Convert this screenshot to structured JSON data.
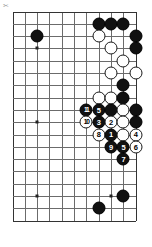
{
  "corner_mark": "✂",
  "board": {
    "grid": {
      "origin_x": 12.5,
      "origin_y": 11.5,
      "spacing": 12.3,
      "cols": 11,
      "rows": 18,
      "line_color": "#6b6b6b",
      "edge_color": "#333333",
      "background": "#ffffff"
    },
    "star_points": [
      {
        "col": 2,
        "row": 3
      },
      {
        "col": 8,
        "row": 3
      },
      {
        "col": 2,
        "row": 9
      },
      {
        "col": 8,
        "row": 15
      },
      {
        "col": 2,
        "row": 15
      }
    ],
    "colors": {
      "black": "#111111",
      "white": "#ffffff",
      "stone_outline": "#1a1a1a"
    },
    "stones": [
      {
        "name": "black-stone",
        "color": "b",
        "col": 2,
        "row": 2,
        "label": ""
      },
      {
        "name": "black-stone",
        "color": "b",
        "col": 7,
        "row": 1,
        "label": ""
      },
      {
        "name": "black-stone",
        "color": "b",
        "col": 8,
        "row": 1,
        "label": ""
      },
      {
        "name": "black-stone",
        "color": "b",
        "col": 9,
        "row": 1,
        "label": ""
      },
      {
        "name": "white-stone",
        "color": "w",
        "col": 7,
        "row": 2,
        "label": ""
      },
      {
        "name": "black-stone",
        "color": "b",
        "col": 10,
        "row": 2,
        "label": ""
      },
      {
        "name": "white-stone",
        "color": "w",
        "col": 8,
        "row": 3,
        "label": ""
      },
      {
        "name": "black-stone",
        "color": "b",
        "col": 10,
        "row": 3,
        "label": ""
      },
      {
        "name": "white-stone",
        "color": "w",
        "col": 9,
        "row": 4,
        "label": ""
      },
      {
        "name": "white-stone",
        "color": "w",
        "col": 8,
        "row": 5,
        "label": ""
      },
      {
        "name": "white-stone",
        "color": "w",
        "col": 10,
        "row": 5,
        "label": ""
      },
      {
        "name": "black-stone",
        "color": "b",
        "col": 9,
        "row": 6,
        "label": ""
      },
      {
        "name": "white-stone",
        "color": "w",
        "col": 7,
        "row": 7,
        "label": ""
      },
      {
        "name": "white-stone",
        "color": "w",
        "col": 8,
        "row": 7,
        "label": ""
      },
      {
        "name": "black-stone",
        "color": "b",
        "col": 9,
        "row": 7,
        "label": ""
      },
      {
        "name": "black-stone",
        "color": "b",
        "col": 6,
        "row": 8,
        "label": "11"
      },
      {
        "name": "black-stone",
        "color": "b",
        "col": 7,
        "row": 8,
        "label": "5"
      },
      {
        "name": "black-stone",
        "color": "b",
        "col": 8,
        "row": 8,
        "label": ""
      },
      {
        "name": "white-stone",
        "color": "w",
        "col": 9,
        "row": 8,
        "label": ""
      },
      {
        "name": "black-stone",
        "color": "b",
        "col": 10,
        "row": 8,
        "label": ""
      },
      {
        "name": "white-stone",
        "color": "w",
        "col": 6,
        "row": 9,
        "label": "10"
      },
      {
        "name": "black-stone",
        "color": "b",
        "col": 7,
        "row": 9,
        "label": "3"
      },
      {
        "name": "white-stone",
        "color": "w",
        "col": 8,
        "row": 9,
        "label": "2"
      },
      {
        "name": "white-stone",
        "color": "w",
        "col": 9,
        "row": 9,
        "label": ""
      },
      {
        "name": "black-stone",
        "color": "b",
        "col": 10,
        "row": 9,
        "label": ""
      },
      {
        "name": "white-stone",
        "color": "w",
        "col": 7,
        "row": 10,
        "label": "8"
      },
      {
        "name": "black-stone",
        "color": "b",
        "col": 8,
        "row": 10,
        "label": "1"
      },
      {
        "name": "white-stone",
        "color": "w",
        "col": 9,
        "row": 10,
        "label": ""
      },
      {
        "name": "white-stone",
        "color": "w",
        "col": 10,
        "row": 10,
        "label": "4"
      },
      {
        "name": "black-stone",
        "color": "b",
        "col": 8,
        "row": 11,
        "label": "9"
      },
      {
        "name": "black-stone",
        "color": "b",
        "col": 9,
        "row": 11,
        "label": "5"
      },
      {
        "name": "white-stone",
        "color": "w",
        "col": 10,
        "row": 11,
        "label": "6"
      },
      {
        "name": "black-stone",
        "color": "b",
        "col": 9,
        "row": 12,
        "label": "7"
      },
      {
        "name": "black-stone",
        "color": "b",
        "col": 9,
        "row": 15,
        "label": ""
      },
      {
        "name": "black-stone",
        "color": "b",
        "col": 7,
        "row": 16,
        "label": ""
      }
    ]
  }
}
